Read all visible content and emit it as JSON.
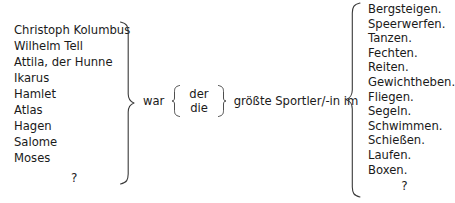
{
  "worksheet": {
    "type": "sentence-construction-exercise",
    "language": "de"
  },
  "subjects": {
    "label": "subject-column",
    "items": [
      "Christoph Kolumbus",
      "Wilhelm Tell",
      "Attila, der Hunne",
      "Ikarus",
      "Hamlet",
      "Atlas",
      "Hagen",
      "Salome",
      "Moses"
    ],
    "placeholder": "?"
  },
  "predicate": {
    "verb": "war",
    "articles": [
      "der",
      "die"
    ],
    "object": "größte Sportler/-in im"
  },
  "sports": {
    "label": "sport-column",
    "items": [
      "Bergsteigen.",
      "Speerwerfen.",
      "Tanzen.",
      "Fechten.",
      "Reiten.",
      "Gewichtheben.",
      "Fliegen.",
      "Segeln.",
      "Schwimmen.",
      "Schießen.",
      "Laufen.",
      "Boxen."
    ],
    "placeholder": "?"
  },
  "style": {
    "background": "#ffffff",
    "text_color": "#1a1a1a",
    "brace_color": "#3a3a3a"
  }
}
